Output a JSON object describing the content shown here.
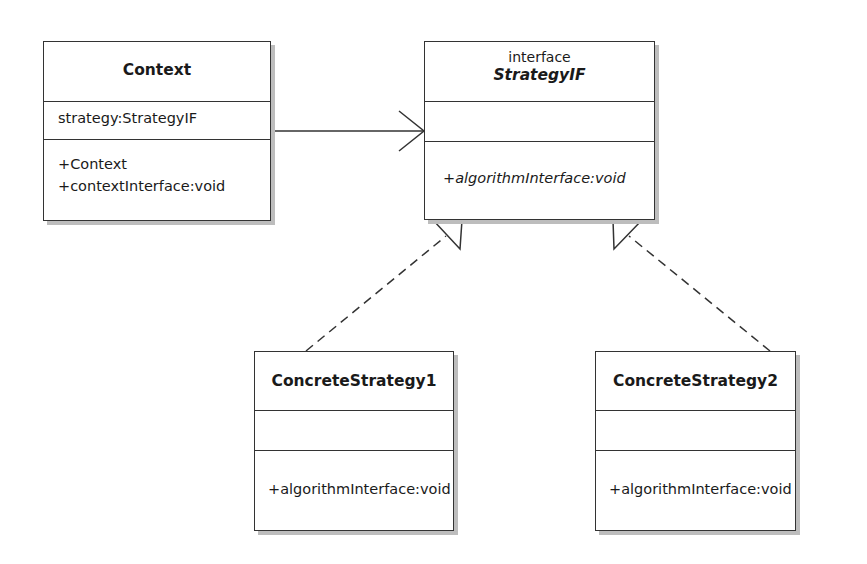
{
  "diagram": {
    "type": "UML class diagram",
    "pattern": "Strategy",
    "colors": {
      "line": "#333333",
      "shadow": "#bdbdbd",
      "background": "#ffffff"
    },
    "classes": {
      "context": {
        "name": "Context",
        "attributes": [
          "strategy:StrategyIF"
        ],
        "operations": [
          "+Context",
          "+contextInterface:void"
        ]
      },
      "strategy_if": {
        "stereotype": "interface",
        "name": "StrategyIF",
        "attributes": [],
        "operations": [
          "+algorithmInterface:void"
        ]
      },
      "concrete1": {
        "name": "ConcreteStrategy1",
        "attributes": [],
        "operations": [
          "+algorithmInterface:void"
        ]
      },
      "concrete2": {
        "name": "ConcreteStrategy2",
        "attributes": [],
        "operations": [
          "+algorithmInterface:void"
        ]
      }
    },
    "relationships": [
      {
        "from": "Context",
        "to": "StrategyIF",
        "kind": "association",
        "arrow": "open"
      },
      {
        "from": "ConcreteStrategy1",
        "to": "StrategyIF",
        "kind": "realization",
        "arrow": "hollow-triangle",
        "line": "dashed"
      },
      {
        "from": "ConcreteStrategy2",
        "to": "StrategyIF",
        "kind": "realization",
        "arrow": "hollow-triangle",
        "line": "dashed"
      }
    ]
  }
}
